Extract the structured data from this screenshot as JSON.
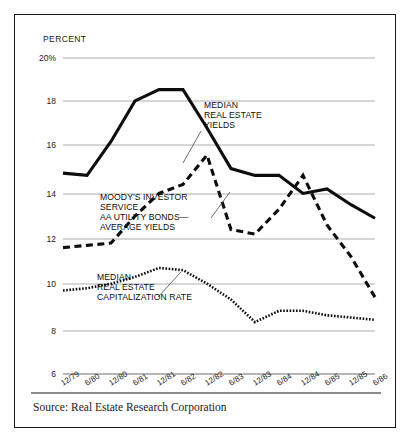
{
  "chart_data": {
    "type": "line",
    "title": "",
    "xlabel": "",
    "ylabel": "PERCENT",
    "ylim": [
      6,
      20
    ],
    "yticks": [
      6,
      8,
      10,
      12,
      14,
      16,
      18,
      20
    ],
    "ytick_labels": [
      "6",
      "8",
      "10",
      "12",
      "14",
      "16",
      "18",
      "20%"
    ],
    "grid": true,
    "legend_position": "inline-annotations",
    "categories": [
      "12/79",
      "6/80",
      "12/80",
      "6/81",
      "12/81",
      "6/82",
      "12/82",
      "6/83",
      "12/83",
      "6/84",
      "12/84",
      "6/85",
      "12/85",
      "6/86"
    ],
    "series": [
      {
        "name": "MEDIAN REAL ESTATE YIELDS",
        "style": "solid",
        "values": [
          14.9,
          14.8,
          16.3,
          18.1,
          18.6,
          18.6,
          16.9,
          15.1,
          14.8,
          14.8,
          14.0,
          14.2,
          13.5,
          12.9
        ]
      },
      {
        "name": "MOODY'S INVESTOR SERVICE AA UTILITY BONDS— AVERAGE YIELDS",
        "style": "dashed",
        "values": [
          11.6,
          11.7,
          11.8,
          13.0,
          14.0,
          14.4,
          15.7,
          12.4,
          12.2,
          13.3,
          14.8,
          12.6,
          11.2,
          9.4
        ]
      },
      {
        "name": "MEDIAN REAL ESTATE CAPITALIZATION RATE",
        "style": "dotted",
        "values": [
          9.7,
          9.8,
          10.0,
          10.3,
          10.7,
          10.6,
          10.0,
          9.3,
          8.3,
          8.8,
          8.8,
          8.6,
          8.5,
          8.4
        ]
      }
    ],
    "annotations": [
      {
        "id": "annot-yields",
        "lines": [
          "MEDIAN",
          "REAL ESTATE",
          "YIELDS"
        ]
      },
      {
        "id": "annot-moodys",
        "lines": [
          "MOODY'S INVESTOR",
          "SERVICE",
          "AA UTILITY BONDS—",
          "AVERAGE YIELDS"
        ]
      },
      {
        "id": "annot-caprate",
        "lines": [
          "MEDIAN",
          "REAL ESTATE",
          "CAPITALIZATION RATE"
        ]
      }
    ],
    "source": "Source: Real Estate Research Corporation",
    "colors": {
      "ink": "#0d0d0d",
      "grid": "#8a8a8a",
      "background": "#ffffff",
      "border": "#1a1a1a"
    }
  }
}
